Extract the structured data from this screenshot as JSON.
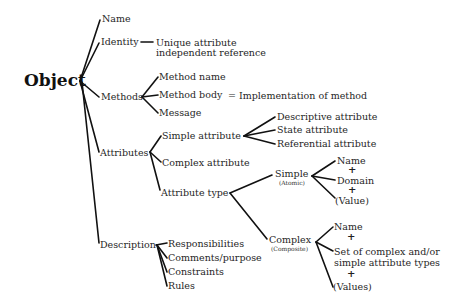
{
  "root": "Object",
  "branches": {
    "name": "Name",
    "identity": "Identity",
    "identity_desc_1": "Unique attribute",
    "identity_desc_2": "independent reference",
    "methods": "Methods",
    "method_name": "Method name",
    "method_body": "Method body",
    "method_body_eq": "= Implementation of method",
    "message": "Message",
    "attributes": "Attributes",
    "simple_attribute": "Simple attribute",
    "descriptive_attribute": "Descriptive attribute",
    "state_attribute": "State attribute",
    "referential_attribute": "Referential attribute",
    "complex_attribute": "Complex attribute",
    "attribute_type": "Attribute type",
    "simple": "Simple",
    "atomic": "(Atomic)",
    "simple_name": "Name",
    "simple_domain": "Domain",
    "simple_value": "(Value)",
    "complex": "Complex",
    "composite": "(Composite)",
    "complex_name": "Name",
    "complex_set_1": "Set of complex and/or",
    "complex_set_2": "simple attribute types",
    "complex_values": "(Values)",
    "plus": "+",
    "description": "Description",
    "responsibilities": "Responsibilities",
    "comments_purpose": "Comments/purpose",
    "constraints": "Constraints",
    "rules": "Rules"
  }
}
